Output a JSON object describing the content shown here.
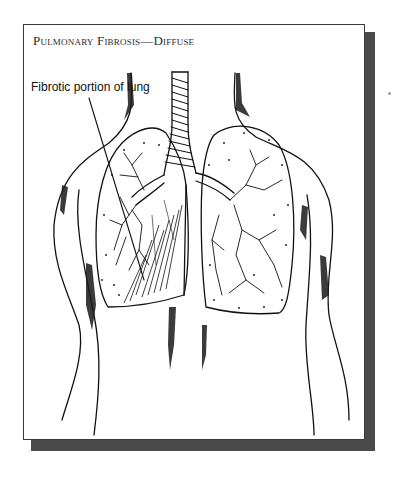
{
  "figure": {
    "title": "Pulmonary Fibrosis—Diffuse",
    "annotations": [
      {
        "label": "Fibrotic portion of lung",
        "target": "lower-left lung region"
      }
    ],
    "colors": {
      "frame_border": "#3a3a3a",
      "shadow": "#4a4a4a",
      "ink": "#111111",
      "background": "#ffffff"
    }
  }
}
